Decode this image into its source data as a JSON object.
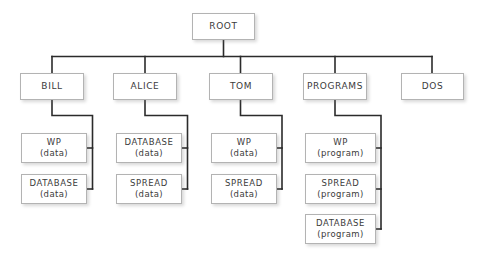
{
  "diagram": {
    "type": "tree",
    "background_color": "#ffffff",
    "box_border_color": "#b3b3b3",
    "box_fill_color": "#ffffff",
    "connector_color": "#2b2b2b",
    "text_color": "#3b3b3b"
  },
  "nodes": {
    "root": {
      "label": "ROOT",
      "sub": ""
    },
    "level1": [
      {
        "label": "BILL",
        "sub": ""
      },
      {
        "label": "ALICE",
        "sub": ""
      },
      {
        "label": "TOM",
        "sub": ""
      },
      {
        "label": "PROGRAMS",
        "sub": ""
      },
      {
        "label": "DOS",
        "sub": ""
      }
    ],
    "bill_children": [
      {
        "label": "WP",
        "sub": "(data)"
      },
      {
        "label": "DATABASE",
        "sub": "(data)"
      }
    ],
    "alice_children": [
      {
        "label": "DATABASE",
        "sub": "(data)"
      },
      {
        "label": "SPREAD",
        "sub": "(data)"
      }
    ],
    "tom_children": [
      {
        "label": "WP",
        "sub": "(data)"
      },
      {
        "label": "SPREAD",
        "sub": "(data)"
      }
    ],
    "programs_children": [
      {
        "label": "WP",
        "sub": "(program)"
      },
      {
        "label": "SPREAD",
        "sub": "(program)"
      },
      {
        "label": "DATABASE",
        "sub": "(program)"
      }
    ],
    "dos_children": []
  }
}
